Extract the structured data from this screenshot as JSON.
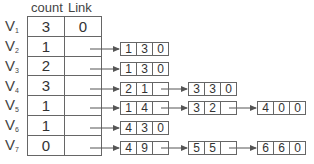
{
  "headers": {
    "count": "count",
    "link": "Link"
  },
  "vertices": [
    {
      "name": "V",
      "sub": "1",
      "count": "3",
      "link": "0",
      "nodes": []
    },
    {
      "name": "V",
      "sub": "2",
      "count": "1",
      "link": "",
      "nodes": [
        [
          "1",
          "3",
          "0"
        ]
      ]
    },
    {
      "name": "V",
      "sub": "3",
      "count": "2",
      "link": "",
      "nodes": [
        [
          "1",
          "3",
          "0"
        ]
      ]
    },
    {
      "name": "V",
      "sub": "4",
      "count": "3",
      "link": "",
      "nodes": [
        [
          "2",
          "1",
          ""
        ],
        [
          "3",
          "3",
          "0"
        ]
      ]
    },
    {
      "name": "V",
      "sub": "5",
      "count": "1",
      "link": "",
      "nodes": [
        [
          "1",
          "4",
          ""
        ],
        [
          "3",
          "2",
          ""
        ],
        [
          "4",
          "0",
          "0"
        ]
      ]
    },
    {
      "name": "V",
      "sub": "6",
      "count": "1",
      "link": "",
      "nodes": [
        [
          "4",
          "3",
          "0"
        ]
      ]
    },
    {
      "name": "V",
      "sub": "7",
      "count": "0",
      "link": "",
      "nodes": [
        [
          "4",
          "9",
          ""
        ],
        [
          "5",
          "5",
          ""
        ],
        [
          "6",
          "6",
          "0"
        ]
      ]
    }
  ],
  "colors": {
    "line": "#666666",
    "text": "#333333",
    "background": "#ffffff"
  }
}
